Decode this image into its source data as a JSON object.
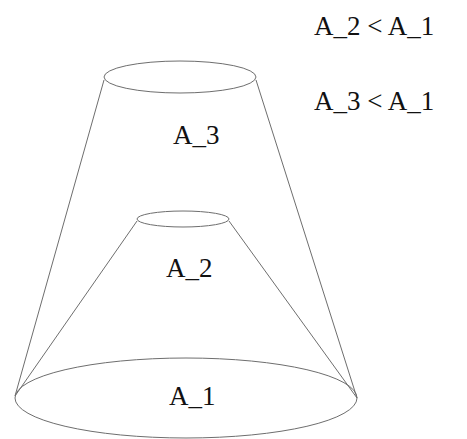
{
  "diagram": {
    "type": "nested-cones-area-comparison",
    "colors": {
      "stroke": "#6e6e6e",
      "text": "#111111",
      "background": "#ffffff"
    },
    "regions": [
      {
        "id": "base",
        "label": "A_1",
        "description": "bottom ellipse (base of both cones)"
      },
      {
        "id": "inner-cap",
        "label": "A_2",
        "description": "small middle ellipse, top of inner cone"
      },
      {
        "id": "outer-cap",
        "label": "A_3",
        "description": "top ellipse, top of outer cone"
      }
    ],
    "relations": [
      {
        "text": "A_2 < A_1",
        "left": "A_2",
        "op": "<",
        "right": "A_1"
      },
      {
        "text": "A_3 < A_1",
        "left": "A_3",
        "op": "<",
        "right": "A_1"
      }
    ]
  }
}
